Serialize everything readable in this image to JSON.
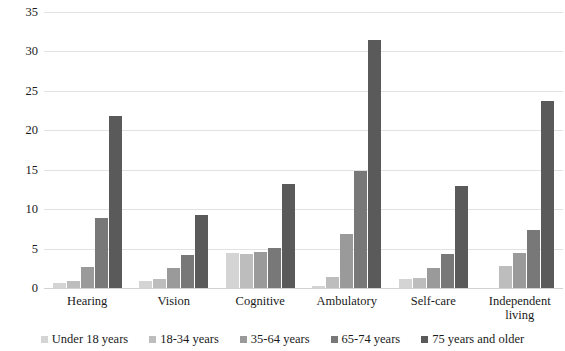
{
  "chart_data": {
    "type": "bar",
    "title": "",
    "subtitle": "",
    "xlabel": "",
    "ylabel": "",
    "ylim": [
      0,
      35
    ],
    "ytick_step": 5,
    "yticks": [
      35,
      30,
      25,
      20,
      15,
      10,
      5,
      0
    ],
    "grid": true,
    "legend_position": "bottom",
    "grouped": true,
    "categories": [
      "Hearing",
      "Vision",
      "Cognitive",
      "Ambulatory",
      "Self-care",
      "Independent living"
    ],
    "series": [
      {
        "name": "Under 18 years",
        "color": "#d4d4d4",
        "values": [
          0.6,
          0.9,
          4.5,
          0.3,
          1.1,
          0.0
        ]
      },
      {
        "name": "18-34 years",
        "color": "#bdbdbd",
        "values": [
          0.9,
          1.2,
          4.3,
          1.4,
          1.3,
          2.8
        ]
      },
      {
        "name": "35-64 years",
        "color": "#9a9a9a",
        "values": [
          2.7,
          2.5,
          4.6,
          6.9,
          2.6,
          4.4
        ]
      },
      {
        "name": "65-74 years",
        "color": "#787878",
        "values": [
          8.9,
          4.2,
          5.1,
          14.8,
          4.3,
          7.4
        ]
      },
      {
        "name": "75 years and older",
        "color": "#5a5a5a",
        "values": [
          21.8,
          9.2,
          13.2,
          31.4,
          12.9,
          23.7
        ]
      }
    ]
  },
  "axis": {
    "y_labels": [
      "35",
      "30",
      "25",
      "20",
      "15",
      "10",
      "5",
      "0"
    ],
    "x_labels": [
      "Hearing",
      "Vision",
      "Cognitive",
      "Ambulatory",
      "Self-care",
      "Independent living"
    ]
  },
  "legend": {
    "entries": [
      {
        "label": "Under 18 years",
        "color": "#d4d4d4"
      },
      {
        "label": "18-34 years",
        "color": "#bdbdbd"
      },
      {
        "label": "35-64 years",
        "color": "#9a9a9a"
      },
      {
        "label": "65-74 years",
        "color": "#787878"
      },
      {
        "label": "75 years and older",
        "color": "#5a5a5a"
      }
    ]
  },
  "style": {
    "gridline_color": "#e2e2e2",
    "baseline_color": "#d2d2d2",
    "background": "#ffffff",
    "text_color": "#1a1a1a"
  }
}
